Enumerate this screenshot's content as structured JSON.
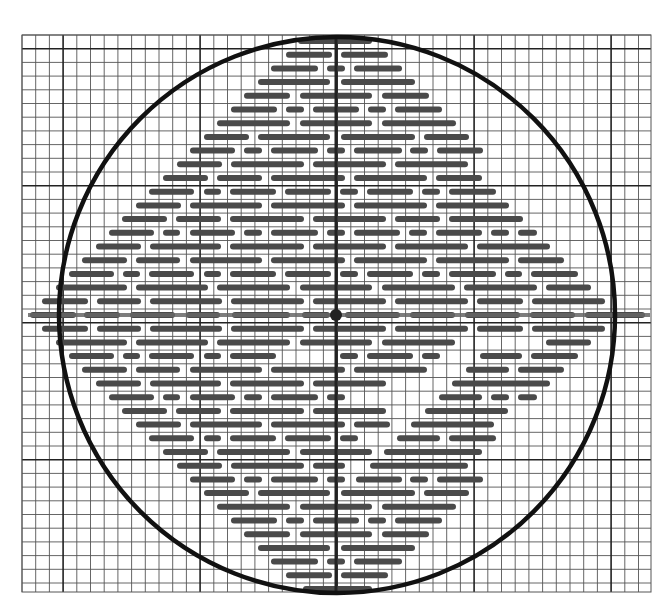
{
  "diagram": {
    "canvas": {
      "width": 668,
      "height": 607
    },
    "grid": {
      "x0": 22,
      "y0": 35,
      "x1": 651,
      "y1": 592,
      "cell": 13.7,
      "major_every": 10,
      "major_offset_x": 3,
      "major_offset_y": 1,
      "minor_color": "#555555",
      "major_color": "#222222"
    },
    "circle": {
      "cx": 337,
      "cy": 315,
      "r": 278,
      "stroke": "#111111",
      "stroke_width": 4.5
    },
    "axes": {
      "vertical": {
        "x": 336,
        "y1": 37,
        "y2": 592,
        "color": "#222222",
        "width": 3
      },
      "horizontal": {
        "y": 315,
        "x1": 28,
        "x2": 650,
        "color": "#666666",
        "width": 4
      }
    },
    "center_dot": {
      "cx": 336,
      "cy": 315,
      "r": 6,
      "color": "#222222"
    },
    "dashes": {
      "color": "#4a4a4a",
      "thickness": 6,
      "row_y0": 41,
      "row_step": 13.7,
      "rows": [
        [
          [
            298,
            372
          ]
        ],
        [
          [
            286,
            332
          ],
          [
            341,
            388
          ]
        ],
        [
          [
            271,
            318
          ],
          [
            327,
            345
          ],
          [
            354,
            402
          ]
        ],
        [
          [
            258,
            330
          ],
          [
            341,
            415
          ]
        ],
        [
          [
            244,
            290
          ],
          [
            300,
            372
          ],
          [
            382,
            429
          ]
        ],
        [
          [
            231,
            277
          ],
          [
            286,
            304
          ],
          [
            313,
            359
          ],
          [
            368,
            386
          ],
          [
            395,
            442
          ]
        ],
        [
          [
            217,
            290
          ],
          [
            300,
            372
          ],
          [
            382,
            456
          ]
        ],
        [
          [
            204,
            249
          ],
          [
            258,
            330
          ],
          [
            341,
            415
          ],
          [
            424,
            469
          ]
        ],
        [
          [
            190,
            235
          ],
          [
            244,
            262
          ],
          [
            271,
            318
          ],
          [
            327,
            345
          ],
          [
            354,
            402
          ],
          [
            410,
            428
          ],
          [
            437,
            483
          ]
        ],
        [
          [
            177,
            222
          ],
          [
            231,
            304
          ],
          [
            313,
            386
          ],
          [
            395,
            468
          ]
        ],
        [
          [
            163,
            208
          ],
          [
            217,
            262
          ],
          [
            271,
            345
          ],
          [
            354,
            427
          ],
          [
            436,
            482
          ]
        ],
        [
          [
            149,
            194
          ],
          [
            204,
            221
          ],
          [
            230,
            276
          ],
          [
            285,
            331
          ],
          [
            340,
            358
          ],
          [
            367,
            413
          ],
          [
            422,
            440
          ],
          [
            449,
            496
          ]
        ],
        [
          [
            136,
            181
          ],
          [
            190,
            262
          ],
          [
            271,
            345
          ],
          [
            354,
            427
          ],
          [
            436,
            509
          ]
        ],
        [
          [
            122,
            167
          ],
          [
            176,
            221
          ],
          [
            230,
            304
          ],
          [
            313,
            386
          ],
          [
            395,
            440
          ],
          [
            449,
            523
          ]
        ],
        [
          [
            109,
            154
          ],
          [
            163,
            180
          ],
          [
            190,
            235
          ],
          [
            244,
            262
          ],
          [
            271,
            318
          ],
          [
            327,
            345
          ],
          [
            354,
            400
          ],
          [
            409,
            427
          ],
          [
            436,
            482
          ],
          [
            491,
            509
          ],
          [
            518,
            537
          ]
        ],
        [
          [
            96,
            141
          ],
          [
            150,
            221
          ],
          [
            230,
            304
          ],
          [
            313,
            386
          ],
          [
            395,
            468
          ],
          [
            477,
            550
          ]
        ],
        [
          [
            82,
            127
          ],
          [
            136,
            180
          ],
          [
            190,
            262
          ],
          [
            271,
            345
          ],
          [
            354,
            427
          ],
          [
            436,
            509
          ],
          [
            518,
            564
          ]
        ],
        [
          [
            69,
            114
          ],
          [
            123,
            140
          ],
          [
            149,
            194
          ],
          [
            204,
            221
          ],
          [
            230,
            276
          ],
          [
            285,
            331
          ],
          [
            340,
            358
          ],
          [
            367,
            413
          ],
          [
            422,
            440
          ],
          [
            449,
            496
          ],
          [
            505,
            522
          ],
          [
            531,
            578
          ]
        ],
        [
          [
            56,
            127
          ],
          [
            136,
            208
          ],
          [
            217,
            290
          ],
          [
            300,
            372
          ],
          [
            382,
            455
          ],
          [
            464,
            537
          ],
          [
            546,
            591
          ]
        ],
        [
          [
            42,
            88
          ],
          [
            97,
            141
          ],
          [
            150,
            222
          ],
          [
            231,
            304
          ],
          [
            313,
            386
          ],
          [
            395,
            468
          ],
          [
            477,
            523
          ],
          [
            532,
            605
          ]
        ],
        [
          [
            30,
            76
          ],
          [
            84,
            120
          ],
          [
            130,
            175
          ],
          [
            186,
            220
          ],
          [
            232,
            290
          ],
          [
            302,
            330
          ],
          [
            345,
            400
          ],
          [
            410,
            455
          ],
          [
            465,
            520
          ],
          [
            530,
            575
          ],
          [
            585,
            645
          ]
        ],
        [
          [
            42,
            88
          ],
          [
            97,
            141
          ],
          [
            150,
            222
          ],
          [
            231,
            304
          ],
          [
            313,
            386
          ],
          [
            395,
            468
          ],
          [
            477,
            523
          ],
          [
            532,
            605
          ]
        ],
        [
          [
            56,
            127
          ],
          [
            136,
            208
          ],
          [
            217,
            290
          ],
          [
            300,
            372
          ],
          [
            382,
            455
          ],
          [
            546,
            591
          ]
        ],
        [
          [
            69,
            114
          ],
          [
            123,
            140
          ],
          [
            149,
            194
          ],
          [
            204,
            221
          ],
          [
            230,
            276
          ],
          [
            340,
            358
          ],
          [
            367,
            413
          ],
          [
            422,
            440
          ],
          [
            480,
            522
          ],
          [
            531,
            578
          ]
        ],
        [
          [
            82,
            127
          ],
          [
            136,
            180
          ],
          [
            190,
            262
          ],
          [
            271,
            345
          ],
          [
            354,
            427
          ],
          [
            466,
            509
          ],
          [
            518,
            564
          ]
        ],
        [
          [
            96,
            141
          ],
          [
            150,
            221
          ],
          [
            230,
            304
          ],
          [
            313,
            386
          ],
          [
            452,
            550
          ]
        ],
        [
          [
            109,
            154
          ],
          [
            163,
            180
          ],
          [
            190,
            235
          ],
          [
            244,
            262
          ],
          [
            271,
            318
          ],
          [
            327,
            345
          ],
          [
            439,
            482
          ],
          [
            491,
            509
          ],
          [
            518,
            537
          ]
        ],
        [
          [
            122,
            167
          ],
          [
            176,
            221
          ],
          [
            230,
            304
          ],
          [
            313,
            386
          ],
          [
            425,
            508
          ]
        ],
        [
          [
            136,
            181
          ],
          [
            190,
            262
          ],
          [
            271,
            345
          ],
          [
            354,
            390
          ],
          [
            411,
            494
          ]
        ],
        [
          [
            149,
            194
          ],
          [
            204,
            221
          ],
          [
            230,
            276
          ],
          [
            285,
            331
          ],
          [
            340,
            358
          ],
          [
            397,
            440
          ],
          [
            449,
            496
          ]
        ],
        [
          [
            163,
            208
          ],
          [
            217,
            290
          ],
          [
            300,
            372
          ],
          [
            384,
            482
          ]
        ],
        [
          [
            177,
            222
          ],
          [
            231,
            304
          ],
          [
            313,
            345
          ],
          [
            370,
            468
          ]
        ],
        [
          [
            190,
            235
          ],
          [
            244,
            262
          ],
          [
            271,
            318
          ],
          [
            327,
            345
          ],
          [
            356,
            402
          ],
          [
            410,
            428
          ],
          [
            437,
            483
          ]
        ],
        [
          [
            204,
            249
          ],
          [
            258,
            330
          ],
          [
            341,
            415
          ],
          [
            424,
            469
          ]
        ],
        [
          [
            217,
            290
          ],
          [
            300,
            372
          ],
          [
            382,
            456
          ]
        ],
        [
          [
            231,
            277
          ],
          [
            286,
            304
          ],
          [
            313,
            359
          ],
          [
            368,
            386
          ],
          [
            395,
            442
          ]
        ],
        [
          [
            244,
            290
          ],
          [
            300,
            372
          ],
          [
            382,
            429
          ]
        ],
        [
          [
            258,
            330
          ],
          [
            341,
            415
          ]
        ],
        [
          [
            271,
            318
          ],
          [
            327,
            345
          ],
          [
            354,
            402
          ]
        ],
        [
          [
            286,
            332
          ],
          [
            341,
            388
          ]
        ],
        [
          [
            303,
            372
          ]
        ]
      ]
    }
  }
}
